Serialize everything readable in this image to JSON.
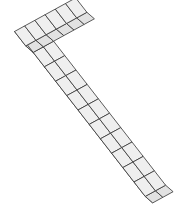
{
  "figure": {
    "colors": {
      "top_face": "#efefef",
      "side_face_dark": "#cfcfcf",
      "side_face_light": "#e2e2e2",
      "edges": "#333333",
      "background": "#ffffff"
    },
    "long_arm": {
      "length_cubes": 11,
      "width_cubes": 2
    },
    "short_arm": {
      "length_cubes": 6,
      "width_cubes": 1
    }
  }
}
